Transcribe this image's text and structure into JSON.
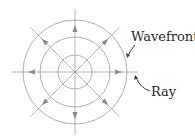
{
  "diagram": {
    "type": "spherical-wave",
    "center": [
      75,
      72
    ],
    "wavefront_radii": [
      17,
      35,
      52
    ],
    "ray_length": 63,
    "ray_angles_deg": [
      0,
      45,
      90,
      135,
      180,
      225,
      270,
      315
    ],
    "arrow_radius": 44,
    "colors": {
      "lines": "#9a9a9a",
      "arrows": "#8c8c8c",
      "text": "#2a2a2a",
      "callout": "#3a3a3a"
    },
    "labels": {
      "wavefront": "Wavefront",
      "ray": "Ray"
    }
  }
}
